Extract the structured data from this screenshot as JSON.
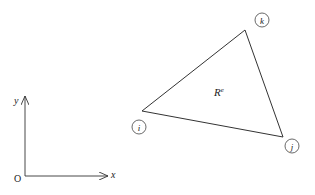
{
  "figure": {
    "element_label": "R",
    "element_label_superscript": "e",
    "nodes": [
      {
        "id": "k",
        "label": "k",
        "vertex": [
          245,
          30
        ],
        "circle": [
          262,
          20
        ]
      },
      {
        "id": "i",
        "label": "i",
        "vertex": [
          142,
          111
        ],
        "circle": [
          139,
          127
        ]
      },
      {
        "id": "j",
        "label": "j",
        "vertex": [
          283,
          137
        ],
        "circle": [
          292,
          146
        ]
      }
    ],
    "axes": {
      "origin_label": "O",
      "x_label": "x",
      "y_label": "y"
    },
    "colors": {
      "stroke": "#333333",
      "background": "#ffffff"
    }
  }
}
